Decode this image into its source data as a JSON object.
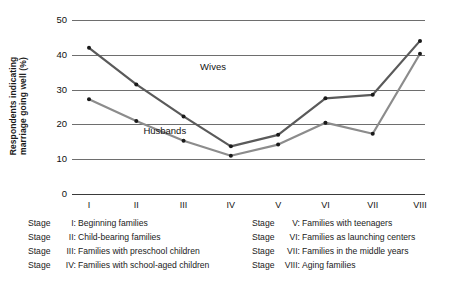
{
  "chart_data": {
    "type": "line",
    "title": "",
    "xlabel": "",
    "ylabel": "Respondents indicating\nmarriage going well (%)",
    "categories": [
      "I",
      "II",
      "III",
      "IV",
      "V",
      "VI",
      "VII",
      "VIII"
    ],
    "ylim": [
      0,
      50
    ],
    "yticks": [
      0,
      10,
      20,
      30,
      40,
      50
    ],
    "grid": true,
    "legend_position": "inline-annotation",
    "series": [
      {
        "name": "Wives",
        "color": "#5a5a5a",
        "values": [
          42,
          31.5,
          22.3,
          13.7,
          17,
          27.5,
          28.5,
          44
        ]
      },
      {
        "name": "Husbands",
        "color": "#8c8c8c",
        "values": [
          27.2,
          21,
          15.3,
          11,
          14.2,
          20.5,
          17.3,
          40.3
        ]
      }
    ],
    "annotations": [
      {
        "text": "Wives",
        "x": 2.35,
        "y": 36.5
      },
      {
        "text": "Husbands",
        "x": 1.15,
        "y": 18.2
      }
    ]
  },
  "axis": {
    "ytick_labels": [
      "50",
      "40",
      "30",
      "20",
      "10",
      "0"
    ],
    "xtick_labels": [
      "I",
      "II",
      "III",
      "IV",
      "V",
      "VI",
      "VII",
      "VIII"
    ]
  },
  "legend": {
    "left": [
      {
        "stage": "Stage",
        "num": "I:",
        "text": "Beginning families"
      },
      {
        "stage": "Stage",
        "num": "II:",
        "text": "Child-bearing families"
      },
      {
        "stage": "Stage",
        "num": "III:",
        "text": "Families with preschool children"
      },
      {
        "stage": "Stage",
        "num": "IV:",
        "text": "Families with school-aged children"
      }
    ],
    "right": [
      {
        "stage": "Stage",
        "num": "V:",
        "text": "Families with teenagers"
      },
      {
        "stage": "Stage",
        "num": "VI:",
        "text": "Families as launching centers"
      },
      {
        "stage": "Stage",
        "num": "VII:",
        "text": "Families in the middle years"
      },
      {
        "stage": "Stage",
        "num": "VIII:",
        "text": "Aging families"
      }
    ]
  },
  "colors": {
    "wives_line": "#5a5a5a",
    "husbands_line": "#8c8c8c",
    "gridline": "#6e6e6e",
    "axis": "#3a3a3a",
    "marker": "#1a1a1a",
    "text": "#111111"
  }
}
